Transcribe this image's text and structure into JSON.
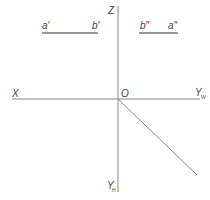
{
  "diagram": {
    "axes": {
      "x_label": "X",
      "z_label": "Z",
      "origin_label": "O",
      "yw_label": "Y",
      "yw_sub": "W",
      "yh_label": "Y",
      "yh_sub": "H"
    },
    "front_view": {
      "left_label": "a′",
      "right_label": "b′"
    },
    "side_view": {
      "left_label": "b″",
      "right_label": "a″"
    }
  }
}
